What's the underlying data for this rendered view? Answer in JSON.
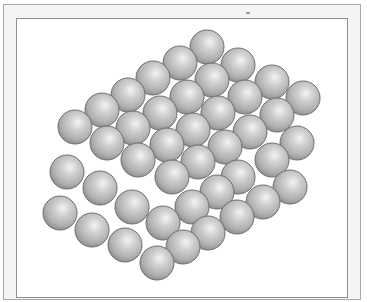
{
  "figure": {
    "sphere_color": "#b8b8b8",
    "sphere_highlight": "#f2f2f2",
    "sphere_edge": "#6e6e6e",
    "sphere_radius": 17,
    "spheres": [
      [
        207,
        47
      ],
      [
        180,
        63
      ],
      [
        238,
        65
      ],
      [
        153,
        78
      ],
      [
        212,
        80
      ],
      [
        272,
        82
      ],
      [
        128,
        95
      ],
      [
        187,
        97
      ],
      [
        245,
        97
      ],
      [
        303,
        98
      ],
      [
        102,
        110
      ],
      [
        160,
        113
      ],
      [
        218,
        113
      ],
      [
        277,
        115
      ],
      [
        75,
        127
      ],
      [
        133,
        128
      ],
      [
        193,
        130
      ],
      [
        250,
        132
      ],
      [
        107,
        143
      ],
      [
        167,
        145
      ],
      [
        225,
        147
      ],
      [
        297,
        143
      ],
      [
        138,
        160
      ],
      [
        198,
        162
      ],
      [
        272,
        160
      ],
      [
        67,
        172
      ],
      [
        172,
        177
      ],
      [
        238,
        177
      ],
      [
        290,
        187
      ],
      [
        100,
        188
      ],
      [
        217,
        192
      ],
      [
        263,
        202
      ],
      [
        132,
        207
      ],
      [
        192,
        207
      ],
      [
        237,
        217
      ],
      [
        60,
        213
      ],
      [
        163,
        223
      ],
      [
        208,
        233
      ],
      [
        92,
        230
      ],
      [
        183,
        247
      ],
      [
        125,
        245
      ],
      [
        157,
        263
      ]
    ]
  }
}
